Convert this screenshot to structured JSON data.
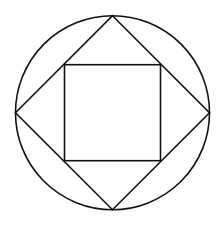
{
  "diagram": {
    "colors": {
      "stroke": "#111111",
      "background": "#ffffff"
    },
    "circle": {
      "cx": 112.5,
      "cy": 112.7,
      "r": 97
    },
    "diamond": {
      "points": "112.5,15.7 209.5,112.7 112.5,209.7 15.5,112.7"
    },
    "inner_square": {
      "x": 64.5,
      "y": 64.7,
      "width": 96,
      "height": 96
    }
  }
}
